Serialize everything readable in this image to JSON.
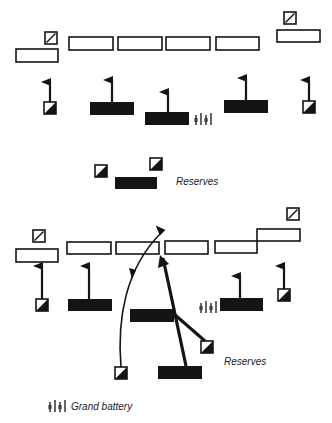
{
  "diagram": {
    "top": {
      "reserves_label": "Reserves"
    },
    "bottom": {
      "reserves_label": "Reserves"
    },
    "legend": {
      "grand_battery_label": "Grand battery",
      "grand_battery_icon": "artillery-battery-icon"
    },
    "symbols": {
      "infantry_line": "open-rectangle",
      "cavalry": "square-with-diagonal",
      "massed_unit": "filled-rectangle",
      "advancing_cavalry": "square-half-filled",
      "artillery": "battery-glyph"
    },
    "colors": {
      "ink": "#141414",
      "paper": "#ffffff"
    }
  }
}
